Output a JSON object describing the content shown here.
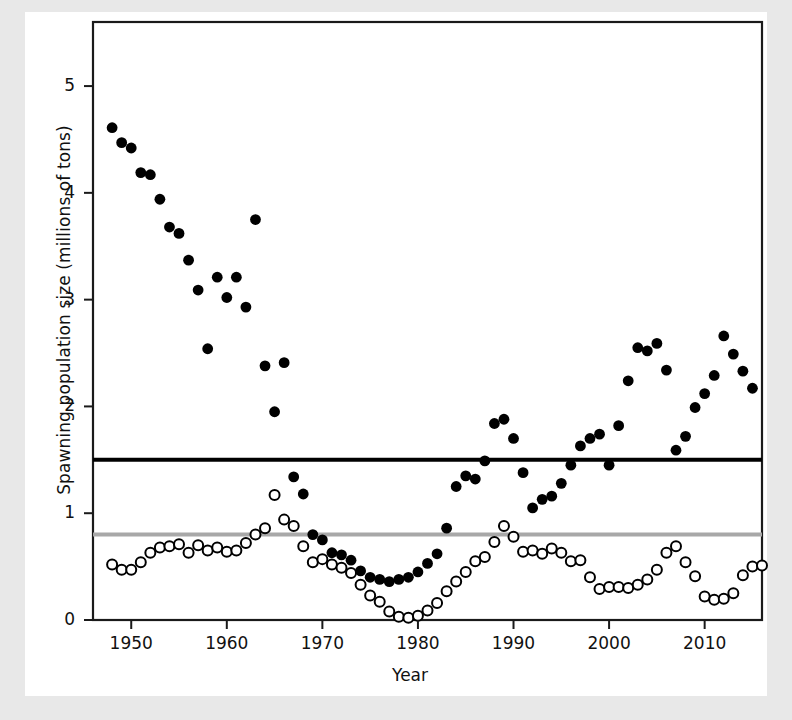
{
  "figure": {
    "background": "#ffffff",
    "page_border_color": "#e8e8e8",
    "axis_color": "#1a1a1a"
  },
  "chart_data": {
    "type": "scatter",
    "title": "",
    "xlabel": "Year",
    "ylabel": "Spawning population size (millions of tons)",
    "xlim": [
      1946,
      2016
    ],
    "ylim": [
      0,
      5.6
    ],
    "xticks": [
      1950,
      1960,
      1970,
      1980,
      1990,
      2000,
      2010
    ],
    "yticks": [
      0,
      1,
      2,
      3,
      4,
      5
    ],
    "grid": false,
    "legend": "none",
    "reference_lines": [
      {
        "name": "upper-reference-line",
        "value": 1.5,
        "color": "#000000",
        "width": 4
      },
      {
        "name": "lower-reference-line",
        "value": 0.8,
        "color": "#a8a8a8",
        "width": 4
      }
    ],
    "series": [
      {
        "name": "filled-markers",
        "marker": "filled-circle",
        "color": "#000000",
        "points": [
          [
            1948,
            4.61
          ],
          [
            1949,
            4.47
          ],
          [
            1950,
            4.42
          ],
          [
            1951,
            4.19
          ],
          [
            1952,
            4.17
          ],
          [
            1953,
            3.94
          ],
          [
            1954,
            3.68
          ],
          [
            1955,
            3.62
          ],
          [
            1956,
            3.37
          ],
          [
            1957,
            3.09
          ],
          [
            1958,
            2.54
          ],
          [
            1959,
            3.21
          ],
          [
            1960,
            3.02
          ],
          [
            1961,
            3.21
          ],
          [
            1962,
            2.93
          ],
          [
            1963,
            3.75
          ],
          [
            1964,
            2.38
          ],
          [
            1965,
            1.95
          ],
          [
            1966,
            2.41
          ],
          [
            1967,
            1.34
          ],
          [
            1968,
            1.18
          ],
          [
            1969,
            0.8
          ],
          [
            1970,
            0.75
          ],
          [
            1971,
            0.63
          ],
          [
            1972,
            0.61
          ],
          [
            1973,
            0.56
          ],
          [
            1974,
            0.46
          ],
          [
            1975,
            0.4
          ],
          [
            1976,
            0.38
          ],
          [
            1977,
            0.36
          ],
          [
            1978,
            0.38
          ],
          [
            1979,
            0.4
          ],
          [
            1980,
            0.45
          ],
          [
            1981,
            0.53
          ],
          [
            1982,
            0.62
          ],
          [
            1983,
            0.86
          ],
          [
            1984,
            1.25
          ],
          [
            1985,
            1.35
          ],
          [
            1986,
            1.32
          ],
          [
            1987,
            1.49
          ],
          [
            1988,
            1.84
          ],
          [
            1989,
            1.88
          ],
          [
            1990,
            1.7
          ],
          [
            1991,
            1.38
          ],
          [
            1992,
            1.05
          ],
          [
            1993,
            1.13
          ],
          [
            1994,
            1.16
          ],
          [
            1995,
            1.28
          ],
          [
            1996,
            1.45
          ],
          [
            1997,
            1.63
          ],
          [
            1998,
            1.7
          ],
          [
            1999,
            1.74
          ],
          [
            2000,
            1.45
          ],
          [
            2001,
            1.82
          ],
          [
            2002,
            2.24
          ],
          [
            2003,
            2.55
          ],
          [
            2004,
            2.52
          ],
          [
            2005,
            2.59
          ],
          [
            2006,
            2.34
          ],
          [
            2007,
            1.59
          ],
          [
            2008,
            1.72
          ],
          [
            2009,
            1.99
          ],
          [
            2010,
            2.12
          ],
          [
            2011,
            2.29
          ],
          [
            2012,
            2.66
          ],
          [
            2013,
            2.49
          ],
          [
            2014,
            2.33
          ],
          [
            2015,
            2.17
          ]
        ]
      },
      {
        "name": "open-markers",
        "marker": "open-circle",
        "color": "#000000",
        "points": [
          [
            1948,
            0.52
          ],
          [
            1949,
            0.47
          ],
          [
            1950,
            0.47
          ],
          [
            1951,
            0.54
          ],
          [
            1952,
            0.63
          ],
          [
            1953,
            0.68
          ],
          [
            1954,
            0.69
          ],
          [
            1955,
            0.71
          ],
          [
            1956,
            0.63
          ],
          [
            1957,
            0.7
          ],
          [
            1958,
            0.65
          ],
          [
            1959,
            0.68
          ],
          [
            1960,
            0.64
          ],
          [
            1961,
            0.65
          ],
          [
            1962,
            0.72
          ],
          [
            1963,
            0.8
          ],
          [
            1964,
            0.86
          ],
          [
            1965,
            1.17
          ],
          [
            1966,
            0.94
          ],
          [
            1967,
            0.88
          ],
          [
            1968,
            0.69
          ],
          [
            1969,
            0.54
          ],
          [
            1970,
            0.57
          ],
          [
            1971,
            0.52
          ],
          [
            1972,
            0.49
          ],
          [
            1973,
            0.44
          ],
          [
            1974,
            0.33
          ],
          [
            1975,
            0.23
          ],
          [
            1976,
            0.17
          ],
          [
            1977,
            0.08
          ],
          [
            1978,
            0.03
          ],
          [
            1979,
            0.02
          ],
          [
            1980,
            0.04
          ],
          [
            1981,
            0.09
          ],
          [
            1982,
            0.16
          ],
          [
            1983,
            0.27
          ],
          [
            1984,
            0.36
          ],
          [
            1985,
            0.45
          ],
          [
            1986,
            0.55
          ],
          [
            1987,
            0.59
          ],
          [
            1988,
            0.73
          ],
          [
            1989,
            0.88
          ],
          [
            1990,
            0.78
          ],
          [
            1991,
            0.64
          ],
          [
            1992,
            0.65
          ],
          [
            1993,
            0.62
          ],
          [
            1994,
            0.67
          ],
          [
            1995,
            0.63
          ],
          [
            1996,
            0.55
          ],
          [
            1997,
            0.56
          ],
          [
            1998,
            0.4
          ],
          [
            1999,
            0.29
          ],
          [
            2000,
            0.31
          ],
          [
            2001,
            0.31
          ],
          [
            2002,
            0.3
          ],
          [
            2003,
            0.33
          ],
          [
            2004,
            0.38
          ],
          [
            2005,
            0.47
          ],
          [
            2006,
            0.63
          ],
          [
            2007,
            0.69
          ],
          [
            2008,
            0.54
          ],
          [
            2009,
            0.41
          ],
          [
            2010,
            0.22
          ],
          [
            2011,
            0.19
          ],
          [
            2012,
            0.2
          ],
          [
            2013,
            0.25
          ],
          [
            2014,
            0.42
          ],
          [
            2015,
            0.5
          ],
          [
            2016,
            0.51
          ]
        ]
      }
    ]
  }
}
